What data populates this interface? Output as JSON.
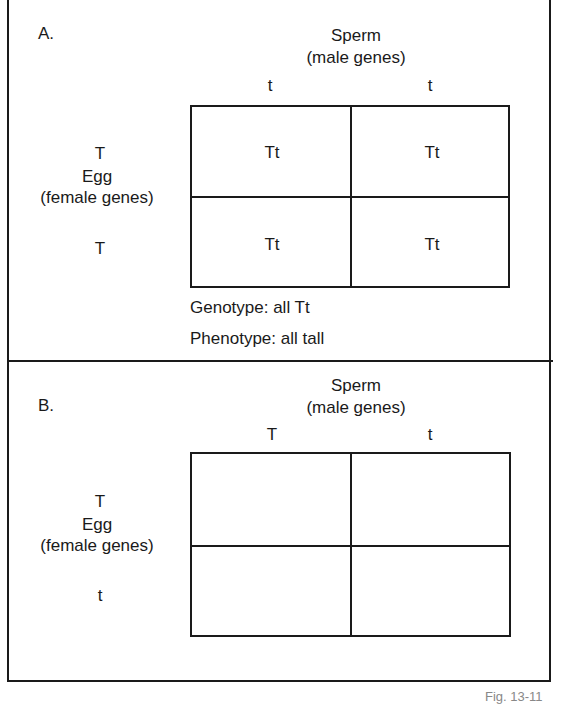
{
  "panels": [
    {
      "label": "A.",
      "parent_top": {
        "title": "Sperm",
        "subtitle": "(male genes)"
      },
      "column_alleles": [
        "t",
        "t"
      ],
      "parent_left": {
        "title": "Egg",
        "subtitle": "(female genes)"
      },
      "row_alleles": [
        "T",
        "T"
      ],
      "cells": [
        [
          "Tt",
          "Tt"
        ],
        [
          "Tt",
          "Tt"
        ]
      ],
      "summary": {
        "genotype": "Genotype: all Tt",
        "phenotype": "Phenotype: all tall"
      }
    },
    {
      "label": "B.",
      "parent_top": {
        "title": "Sperm",
        "subtitle": "(male genes)"
      },
      "column_alleles": [
        "T",
        "t"
      ],
      "parent_left": {
        "title": "Egg",
        "subtitle": "(female genes)"
      },
      "row_alleles": [
        "T",
        "t"
      ],
      "cells": [
        [
          "",
          ""
        ],
        [
          "",
          ""
        ]
      ]
    }
  ],
  "footer": {
    "figure_label": "Fig. 13-11"
  }
}
